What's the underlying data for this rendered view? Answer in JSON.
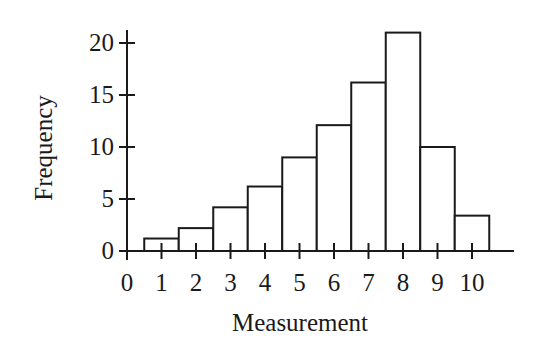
{
  "chart_data": {
    "type": "bar",
    "title": "",
    "xlabel": "Measurement",
    "ylabel": "Frequency",
    "categories": [
      "1",
      "2",
      "3",
      "4",
      "5",
      "6",
      "7",
      "8",
      "9",
      "10"
    ],
    "values": [
      1.2,
      2.2,
      4.2,
      6.2,
      9,
      12.1,
      16.2,
      21,
      10,
      3.4
    ],
    "bin_width": 1,
    "x_ticks": [
      0,
      1,
      2,
      3,
      4,
      5,
      6,
      7,
      8,
      9,
      10
    ],
    "y_ticks": [
      0,
      5,
      10,
      15,
      20
    ],
    "xlim": [
      0,
      11.2
    ],
    "ylim": [
      0,
      22
    ],
    "grid": false,
    "legend": null,
    "style": {
      "bar_fill": "#ffffff",
      "bar_stroke": "#1a1a1a",
      "axis_color": "#1a1a1a"
    }
  }
}
